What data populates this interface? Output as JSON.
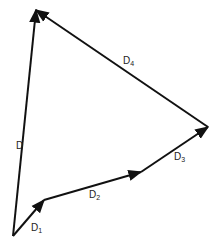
{
  "diagram": {
    "title": "",
    "type": "vector-addition",
    "stroke_color": "#111111",
    "vectors": [
      {
        "name": "D1",
        "label": "D",
        "sub": "1",
        "from": [
          13,
          236
        ],
        "to": [
          44,
          200
        ],
        "label_pos": [
          31,
          223
        ]
      },
      {
        "name": "D2",
        "label": "D",
        "sub": "2",
        "from": [
          44,
          200
        ],
        "to": [
          141,
          172
        ],
        "label_pos": [
          89,
          190
        ]
      },
      {
        "name": "D3",
        "label": "D",
        "sub": "3",
        "from": [
          141,
          172
        ],
        "to": [
          208,
          127
        ],
        "label_pos": [
          174,
          152
        ]
      },
      {
        "name": "D4",
        "label": "D",
        "sub": "4",
        "from": [
          208,
          127
        ],
        "to": [
          36,
          10
        ],
        "label_pos": [
          123,
          56
        ]
      },
      {
        "name": "D",
        "label": "D",
        "sub": "",
        "from": [
          13,
          236
        ],
        "to": [
          36,
          10
        ],
        "label_pos": [
          16,
          141
        ]
      }
    ]
  }
}
